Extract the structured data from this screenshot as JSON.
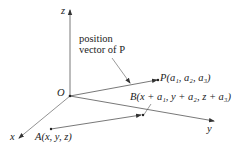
{
  "diagram": {
    "axes": {
      "x_label": "x",
      "y_label": "y",
      "z_label": "z",
      "origin_label": "O"
    },
    "annotation": {
      "line1": "position",
      "line2": "vector of P"
    },
    "points": {
      "P": "P(a₁, a₂, a₃)",
      "B": "B(x + a₁, y + a₂, z + a₃)",
      "A": "A(x, y, z)"
    },
    "colors": {
      "axis": "#555555",
      "text": "#222222"
    }
  }
}
